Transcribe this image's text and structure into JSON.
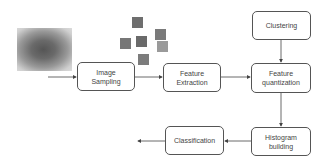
{
  "diagram": {
    "input_image": {
      "label": "texture-image",
      "description": "grayscale textured input image"
    },
    "patches": [
      {
        "x": 132,
        "y": 17,
        "color": "#6e6e6e"
      },
      {
        "x": 155,
        "y": 29,
        "color": "#7a7a7a"
      },
      {
        "x": 136,
        "y": 36,
        "color": "#6a6a6a"
      },
      {
        "x": 120,
        "y": 38,
        "color": "#777777"
      },
      {
        "x": 157,
        "y": 41,
        "color": "#9a9a9a"
      },
      {
        "x": 138,
        "y": 54,
        "color": "#7c7c7c"
      }
    ],
    "nodes": {
      "image_sampling": {
        "line1": "Image",
        "line2": "Sampling"
      },
      "feature_extraction": {
        "line1": "Feature",
        "line2": "Extraction"
      },
      "clustering": {
        "line1": "Clustering"
      },
      "feature_quantization": {
        "line1": "Feature",
        "line2": "quantization"
      },
      "histogram_building": {
        "line1": "Histogram",
        "line2": "building"
      },
      "classification": {
        "line1": "Classification"
      }
    },
    "edges": [
      [
        "input",
        "image_sampling"
      ],
      [
        "image_sampling",
        "feature_extraction"
      ],
      [
        "feature_extraction",
        "feature_quantization"
      ],
      [
        "clustering",
        "feature_quantization"
      ],
      [
        "feature_quantization",
        "histogram_building"
      ],
      [
        "histogram_building",
        "classification"
      ],
      [
        "classification",
        "output"
      ]
    ],
    "colors": {
      "stroke": "#555555",
      "text": "#444444"
    }
  }
}
